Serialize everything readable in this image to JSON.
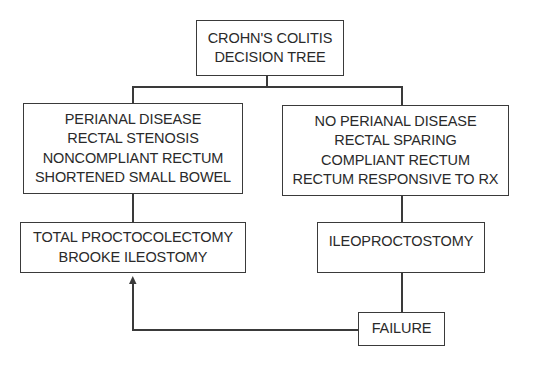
{
  "diagram": {
    "title": "Crohn's colitis decision tree",
    "nodes": {
      "root": {
        "lines": [
          "CROHN'S COLITIS",
          "DECISION TREE"
        ]
      },
      "left_criteria": {
        "lines": [
          "PERIANAL DISEASE",
          "RECTAL STENOSIS",
          "NONCOMPLIANT RECTUM",
          "SHORTENED SMALL BOWEL"
        ]
      },
      "right_criteria": {
        "lines": [
          "NO PERIANAL DISEASE",
          "RECTAL SPARING",
          "COMPLIANT RECTUM",
          "RECTUM RESPONSIVE TO RX"
        ]
      },
      "left_treatment": {
        "lines": [
          "TOTAL PROCTOCOLECTOMY",
          "BROOKE ILEOSTOMY"
        ]
      },
      "right_treatment": {
        "lines": [
          "ILEOPROCTOSTOMY"
        ]
      },
      "failure": {
        "lines": [
          "FAILURE"
        ]
      }
    },
    "edges": [
      {
        "from": "root",
        "to": "left_criteria"
      },
      {
        "from": "root",
        "to": "right_criteria"
      },
      {
        "from": "left_criteria",
        "to": "left_treatment"
      },
      {
        "from": "right_criteria",
        "to": "right_treatment"
      },
      {
        "from": "right_treatment",
        "to": "failure"
      },
      {
        "from": "failure",
        "to": "left_treatment",
        "arrow": true
      }
    ],
    "colors": {
      "line": "#3a3a3a",
      "text": "#2a2a2a",
      "background": "#ffffff"
    }
  }
}
